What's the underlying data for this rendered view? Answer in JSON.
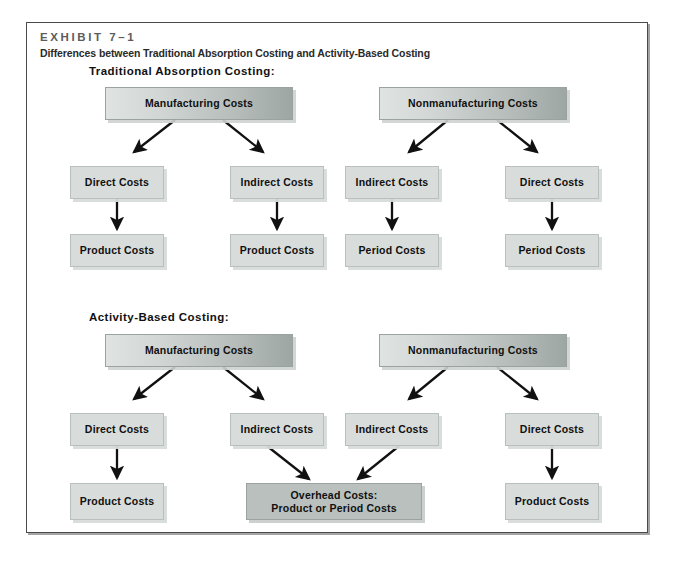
{
  "exhibit": {
    "label": "EXHIBIT 7–1",
    "subtitle": "Differences between Traditional Absorption Costing and Activity-Based Costing"
  },
  "sections": [
    {
      "id": "traditional",
      "title": "Traditional Absorption Costing:",
      "top_nodes": [
        {
          "id": "t-mfg",
          "label": "Manufacturing Costs"
        },
        {
          "id": "t-nonmfg",
          "label": "Nonmanufacturing Costs"
        }
      ],
      "mid_nodes": [
        {
          "id": "t-m-direct",
          "label": "Direct Costs"
        },
        {
          "id": "t-m-indirect",
          "label": "Indirect Costs"
        },
        {
          "id": "t-n-indirect",
          "label": "Indirect Costs"
        },
        {
          "id": "t-n-direct",
          "label": "Direct Costs"
        }
      ],
      "bottom_nodes": [
        {
          "id": "t-b1",
          "label": "Product Costs"
        },
        {
          "id": "t-b2",
          "label": "Product Costs"
        },
        {
          "id": "t-b3",
          "label": "Period Costs"
        },
        {
          "id": "t-b4",
          "label": "Period Costs"
        }
      ]
    },
    {
      "id": "activity-based",
      "title": "Activity-Based Costing:",
      "top_nodes": [
        {
          "id": "a-mfg",
          "label": "Manufacturing Costs"
        },
        {
          "id": "a-nonmfg",
          "label": "Nonmanufacturing Costs"
        }
      ],
      "mid_nodes": [
        {
          "id": "a-m-direct",
          "label": "Direct Costs"
        },
        {
          "id": "a-m-indirect",
          "label": "Indirect Costs"
        },
        {
          "id": "a-n-indirect",
          "label": "Indirect Costs"
        },
        {
          "id": "a-n-direct",
          "label": "Direct Costs"
        }
      ],
      "bottom_nodes": [
        {
          "id": "a-b1",
          "label": "Product Costs"
        },
        {
          "id": "a-overhead-line1",
          "label": "Overhead Costs:"
        },
        {
          "id": "a-overhead-line2",
          "label": "Product or Period Costs"
        },
        {
          "id": "a-b3",
          "label": "Product Costs"
        }
      ]
    }
  ],
  "colors": {
    "frame_border": "#4a4a4a",
    "node_fill": "#d8dddb",
    "node_border": "#b9bfbd",
    "overhead_fill": "#b9c0bd",
    "top_gradient_light": "#dfe3e1",
    "top_gradient_dark": "#9ea6a3",
    "arrow": "#111111",
    "exhibit_label_text": "#5c5c5c",
    "body_text": "#101010",
    "page_background": "#ffffff"
  }
}
